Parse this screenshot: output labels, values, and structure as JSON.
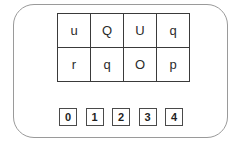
{
  "worksheet": {
    "title": "Letter Grid Worksheet",
    "background_color": "#ffffff",
    "card": {
      "border_color": "#9a9a9a",
      "corner_radius": "21px"
    },
    "letter_grid": {
      "rows": 2,
      "columns": 4,
      "border_color": "#3a3a3a",
      "text_color": "#2b2b2b",
      "cells": [
        [
          {
            "label": "u"
          },
          {
            "label": "Q"
          },
          {
            "label": "U"
          },
          {
            "label": "q"
          }
        ],
        [
          {
            "label": "r"
          },
          {
            "label": "q"
          },
          {
            "label": "O"
          },
          {
            "label": "p"
          }
        ]
      ]
    },
    "number_strip": {
      "border_color": "#4a4a4a",
      "text_color": "#1f1f1f",
      "boxes": [
        {
          "label": "0"
        },
        {
          "label": "1"
        },
        {
          "label": "2"
        },
        {
          "label": "3"
        },
        {
          "label": "4"
        }
      ]
    }
  }
}
